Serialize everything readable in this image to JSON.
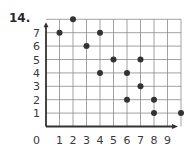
{
  "problem_label": "14.",
  "colors": {
    "grid": "#8a8a8a",
    "axis": "#333333",
    "point": "#333333",
    "text": "#3a3a3a"
  },
  "chart_data": {
    "type": "scatter",
    "title": "",
    "xlabel": "",
    "ylabel": "",
    "origin_label": "0",
    "x_ticks": [
      1,
      2,
      3,
      4,
      5,
      6,
      7,
      8,
      9
    ],
    "y_ticks": [
      1,
      2,
      3,
      4,
      5,
      6,
      7
    ],
    "xlim": [
      0,
      10
    ],
    "ylim": [
      0,
      8
    ],
    "grid": true,
    "legend": null,
    "points": [
      {
        "x": 1,
        "y": 7
      },
      {
        "x": 2,
        "y": 8
      },
      {
        "x": 3,
        "y": 6
      },
      {
        "x": 4,
        "y": 7
      },
      {
        "x": 4,
        "y": 4
      },
      {
        "x": 5,
        "y": 5
      },
      {
        "x": 6,
        "y": 4
      },
      {
        "x": 6,
        "y": 2
      },
      {
        "x": 7,
        "y": 5
      },
      {
        "x": 7,
        "y": 3
      },
      {
        "x": 8,
        "y": 2
      },
      {
        "x": 8,
        "y": 1
      },
      {
        "x": 10,
        "y": 1
      }
    ]
  }
}
